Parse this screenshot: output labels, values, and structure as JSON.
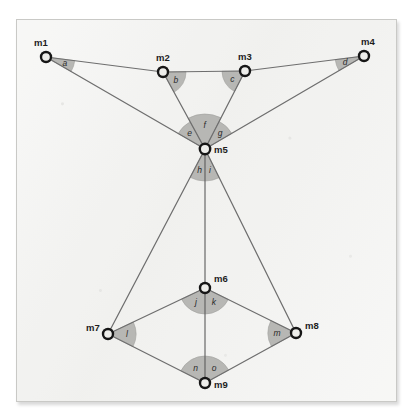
{
  "figure": {
    "background_color": "#f2f2f0",
    "frame_border_color": "#c9c9c6",
    "edge_color": "#6e6e6e",
    "wedge_fill_color": "#b3b3b0",
    "node_ring_color": "#161616",
    "node_fill_color": "#ededea"
  },
  "nodes": [
    {
      "id": "m1",
      "label": "m1",
      "cx": 46,
      "cy": 57,
      "r": 6.2,
      "label_dx": -12,
      "label_dy": -11
    },
    {
      "id": "m2",
      "label": "m2",
      "cx": 163,
      "cy": 72,
      "r": 6.2,
      "label_dx": -7,
      "label_dy": -11
    },
    {
      "id": "m3",
      "label": "m3",
      "cx": 245,
      "cy": 71,
      "r": 6.2,
      "label_dx": -7,
      "label_dy": -11
    },
    {
      "id": "m4",
      "label": "m4",
      "cx": 364,
      "cy": 56,
      "r": 6.2,
      "label_dx": -3,
      "label_dy": -11
    },
    {
      "id": "m5",
      "label": "m5",
      "cx": 205,
      "cy": 149,
      "r": 6.4,
      "label_dx": 9,
      "label_dy": 4
    },
    {
      "id": "m6",
      "label": "m6",
      "cx": 205,
      "cy": 288,
      "r": 6.2,
      "label_dx": 9,
      "label_dy": -6
    },
    {
      "id": "m7",
      "label": "m7",
      "cx": 108,
      "cy": 334,
      "r": 6.2,
      "label_dx": -22,
      "label_dy": -3
    },
    {
      "id": "m8",
      "label": "m8",
      "cx": 296,
      "cy": 333,
      "r": 6.2,
      "label_dx": 9,
      "label_dy": -4
    },
    {
      "id": "m9",
      "label": "m9",
      "cx": 205,
      "cy": 383,
      "r": 6.2,
      "label_dx": 9,
      "label_dy": 5
    }
  ],
  "edges": [
    {
      "id": "e-m1-m2",
      "from": "m1",
      "to": "m2"
    },
    {
      "id": "e-m1-m5",
      "from": "m1",
      "to": "m5"
    },
    {
      "id": "e-m2-m3",
      "from": "m2",
      "to": "m3"
    },
    {
      "id": "e-m2-m5",
      "from": "m2",
      "to": "m5"
    },
    {
      "id": "e-m3-m4",
      "from": "m3",
      "to": "m4"
    },
    {
      "id": "e-m3-m5",
      "from": "m3",
      "to": "m5"
    },
    {
      "id": "e-m4-m5",
      "from": "m4",
      "to": "m5"
    },
    {
      "id": "e-m5-m7",
      "from": "m5",
      "to": "m7"
    },
    {
      "id": "e-m5-m6",
      "from": "m5",
      "to": "m6"
    },
    {
      "id": "e-m5-m8",
      "from": "m5",
      "to": "m8"
    },
    {
      "id": "e-m6-m7",
      "from": "m6",
      "to": "m7"
    },
    {
      "id": "e-m6-m8",
      "from": "m6",
      "to": "m8"
    },
    {
      "id": "e-m6-m9",
      "from": "m6",
      "to": "m9"
    },
    {
      "id": "e-m7-m9",
      "from": "m7",
      "to": "m9"
    },
    {
      "id": "e-m8-m9",
      "from": "m8",
      "to": "m9"
    }
  ],
  "angles": [
    {
      "id": "a",
      "label": "a",
      "vertex": "m1",
      "ray1": "m2",
      "ray2": "m5",
      "radius": 29,
      "label_radius": 20
    },
    {
      "id": "b",
      "label": "b",
      "vertex": "m2",
      "ray1": "m3",
      "ray2": "m5",
      "radius": 23,
      "label_radius": 15
    },
    {
      "id": "c",
      "label": "c",
      "vertex": "m3",
      "ray1": "m5",
      "ray2": "m2",
      "radius": 23,
      "label_radius": 15
    },
    {
      "id": "d",
      "label": "d",
      "vertex": "m4",
      "ray1": "m5",
      "ray2": "m3",
      "radius": 29,
      "label_radius": 20
    },
    {
      "id": "e",
      "label": "e",
      "vertex": "m5",
      "ray1": "m1",
      "ray2": "m2",
      "radius": 31,
      "label_radius": 22
    },
    {
      "id": "f",
      "label": "f",
      "vertex": "m5",
      "ray1": "m2",
      "ray2": "m3",
      "radius": 35,
      "label_radius": 24
    },
    {
      "id": "g",
      "label": "g",
      "vertex": "m5",
      "ray1": "m3",
      "ray2": "m4",
      "radius": 31,
      "label_radius": 22
    },
    {
      "id": "h",
      "label": "h",
      "vertex": "m5",
      "ray1": "m7",
      "ray2": "m6",
      "radius": 32,
      "label_radius": 22
    },
    {
      "id": "i",
      "label": "i",
      "vertex": "m5",
      "ray1": "m6",
      "ray2": "m8",
      "radius": 32,
      "label_radius": 22
    },
    {
      "id": "j",
      "label": "j",
      "vertex": "m6",
      "ray1": "m7",
      "ray2": "m9",
      "radius": 26,
      "label_radius": 17
    },
    {
      "id": "k",
      "label": "k",
      "vertex": "m6",
      "ray1": "m9",
      "ray2": "m8",
      "radius": 26,
      "label_radius": 17
    },
    {
      "id": "l",
      "label": "l",
      "vertex": "m7",
      "ray1": "m6",
      "ray2": "m9",
      "radius": 28,
      "label_radius": 19
    },
    {
      "id": "m",
      "label": "m",
      "vertex": "m8",
      "ray1": "m9",
      "ray2": "m6",
      "radius": 28,
      "label_radius": 19
    },
    {
      "id": "n",
      "label": "n",
      "vertex": "m9",
      "ray1": "m7",
      "ray2": "m6",
      "radius": 27,
      "label_radius": 18
    },
    {
      "id": "o",
      "label": "o",
      "vertex": "m9",
      "ray1": "m6",
      "ray2": "m8",
      "radius": 27,
      "label_radius": 18
    }
  ]
}
